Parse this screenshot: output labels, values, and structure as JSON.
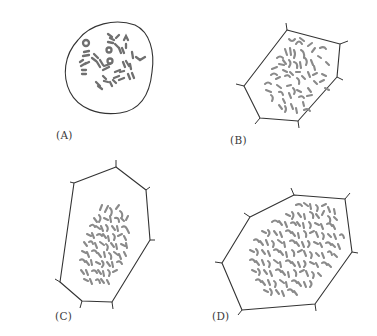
{
  "figure": {
    "panels": [
      {
        "id": "A",
        "label": "(A)",
        "shape": "round-cell",
        "chromosome_density": "sparse"
      },
      {
        "id": "B",
        "label": "(B)",
        "shape": "polygonal-cell",
        "chromosome_density": "moderate"
      },
      {
        "id": "C",
        "label": "(C)",
        "shape": "polygonal-cell",
        "chromosome_density": "dense"
      },
      {
        "id": "D",
        "label": "(D)",
        "shape": "polygonal-cell",
        "chromosome_density": "very-dense"
      }
    ]
  },
  "colors": {
    "outline": "#333333",
    "chromosome": "#8a8a8a",
    "background": "#ffffff",
    "label": "#3a3a3a"
  }
}
